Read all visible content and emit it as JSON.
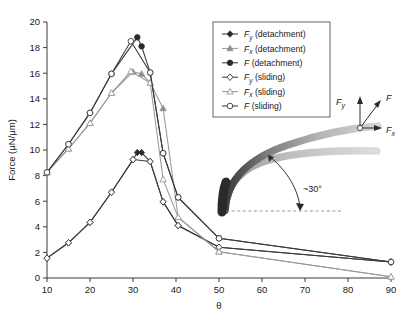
{
  "chart_data": {
    "type": "line",
    "title": "",
    "xlabel": "θ",
    "ylabel": "Force (μN/μm)",
    "xlim": [
      10,
      90
    ],
    "ylim": [
      0,
      20
    ],
    "xticks": [
      10,
      20,
      30,
      40,
      50,
      60,
      70,
      80,
      90
    ],
    "yticks": [
      0,
      2,
      4,
      6,
      8,
      10,
      12,
      14,
      16,
      18,
      20
    ],
    "grid": false,
    "legend_position": "top-right",
    "series": [
      {
        "name": "Fy (detachment)",
        "label_symbol": "F",
        "label_sub": "y",
        "label_rest": " (detachment)",
        "marker": "filled-diamond",
        "color": "#2b2b2b",
        "x": [
          10,
          15,
          20,
          25,
          30,
          31,
          32,
          34,
          37,
          40.5,
          50,
          90
        ],
        "y": [
          1.55,
          2.75,
          4.35,
          6.7,
          9.25,
          9.8,
          9.8,
          9.1,
          5.95,
          4.1,
          2.4,
          1.25
        ]
      },
      {
        "name": "Fx (detachment)",
        "label_symbol": "F",
        "label_sub": "x",
        "label_rest": " (detachment)",
        "marker": "filled-triangle",
        "color": "#8f8f8f",
        "x": [
          10,
          15,
          20,
          25,
          30,
          32,
          34,
          37,
          40.5,
          50,
          90
        ],
        "y": [
          8.25,
          10.1,
          12.1,
          14.45,
          16.1,
          15.95,
          15.25,
          13.25,
          4.75,
          2.05,
          0.1
        ]
      },
      {
        "name": "F (detachment)",
        "label_symbol": "F",
        "label_sub": "",
        "label_rest": " (detachment)",
        "marker": "filled-circle",
        "color": "#2b2b2b",
        "x": [
          10,
          15,
          20,
          25,
          31,
          32,
          34,
          37,
          40.5,
          50,
          90
        ],
        "y": [
          8.25,
          10.45,
          12.9,
          15.95,
          18.8,
          18.1,
          16.05,
          9.75,
          6.3,
          3.1,
          1.25
        ]
      },
      {
        "name": "Fy (sliding)",
        "label_symbol": "F",
        "label_sub": "y",
        "label_rest": " (sliding)",
        "marker": "open-diamond",
        "color": "#3b3b3b",
        "x": [
          10,
          15,
          20,
          25,
          30,
          34,
          37,
          40.5,
          50,
          90
        ],
        "y": [
          1.55,
          2.75,
          4.35,
          6.7,
          9.25,
          9.1,
          5.95,
          4.1,
          2.4,
          1.25
        ]
      },
      {
        "name": "Fx (sliding)",
        "label_symbol": "F",
        "label_sub": "x",
        "label_rest": " (sliding)",
        "marker": "open-triangle",
        "color": "#9a9a9a",
        "x": [
          10,
          15,
          20,
          25,
          29.5,
          34,
          37,
          40.5,
          50,
          90
        ],
        "y": [
          8.25,
          10.1,
          12.1,
          14.45,
          16.15,
          15.25,
          7.7,
          4.75,
          2.05,
          0.1
        ]
      },
      {
        "name": "F (sliding)",
        "label_symbol": "F",
        "label_sub": "",
        "label_rest": " (sliding)",
        "marker": "open-circle",
        "color": "#3b3b3b",
        "x": [
          10,
          15,
          20,
          25,
          29.5,
          34,
          37,
          40.5,
          50,
          90
        ],
        "y": [
          8.25,
          10.45,
          12.9,
          15.95,
          18.5,
          16.05,
          9.75,
          6.3,
          3.1,
          1.25
        ]
      }
    ]
  },
  "legend": {
    "entries": [
      "F_y (detachment)",
      "F_x (detachment)",
      "F (detachment)",
      "F_y (sliding)",
      "F_x (sliding)",
      "F (sliding)"
    ]
  },
  "inset": {
    "vector_fy": "F",
    "vector_fy_sub": "y",
    "vector_f": "F",
    "vector_fx": "F",
    "vector_fx_sub": "x",
    "angle_label": "~30°"
  },
  "axes": {
    "x_title": "θ",
    "y_title": "Force (μN/μm)",
    "x_tick_labels": [
      "10",
      "20",
      "30",
      "40",
      "50",
      "60",
      "70",
      "80",
      "90"
    ],
    "y_tick_labels": [
      "0",
      "2",
      "4",
      "6",
      "8",
      "10",
      "12",
      "14",
      "16",
      "18",
      "20"
    ]
  }
}
